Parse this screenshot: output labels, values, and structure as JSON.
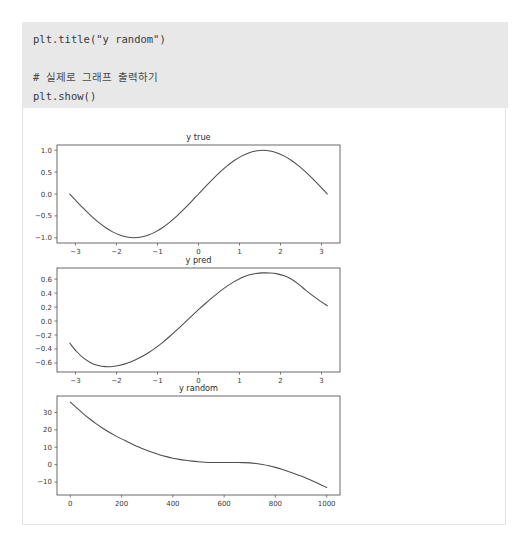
{
  "notebook": {
    "code_cell": {
      "lines": [
        {
          "text": "plt.title(\"y random\")",
          "kind": "code"
        },
        {
          "text": " ",
          "kind": "blank"
        },
        {
          "text": "# 실제로 그래프 출력하기",
          "kind": "comment"
        },
        {
          "text": "plt.show()",
          "kind": "code"
        }
      ],
      "background": "#e8e8e8"
    }
  },
  "chart_data": [
    {
      "type": "line",
      "title": "y true",
      "xlabel": "",
      "ylabel": "",
      "xlim": [
        -3.45,
        3.45
      ],
      "ylim": [
        -1.12,
        1.12
      ],
      "xticks": [
        -3,
        -2,
        -1,
        0,
        1,
        2,
        3
      ],
      "xticklabels": [
        "−3",
        "−2",
        "−1",
        "0",
        "1",
        "2",
        "3"
      ],
      "yticks": [
        -1.0,
        -0.5,
        0.0,
        0.5,
        1.0
      ],
      "yticklabels": [
        "−1.0",
        "−0.5",
        "0.0",
        "0.5",
        "1.0"
      ],
      "grid": false,
      "legend": null,
      "series": [
        {
          "name": "y true",
          "comment": "sin(x) over -pi..pi",
          "x": [
            -3.1416,
            -2.9671,
            -2.7925,
            -2.618,
            -2.4435,
            -2.2689,
            -2.0944,
            -1.9199,
            -1.7453,
            -1.5708,
            -1.3963,
            -1.2217,
            -1.0472,
            -0.8727,
            -0.6981,
            -0.5236,
            -0.3491,
            -0.1745,
            0.0,
            0.1745,
            0.3491,
            0.5236,
            0.6981,
            0.8727,
            1.0472,
            1.2217,
            1.3963,
            1.5708,
            1.7453,
            1.9199,
            2.0944,
            2.2689,
            2.4435,
            2.618,
            2.7925,
            2.9671,
            3.1416
          ],
          "y": [
            0.0,
            -0.1736,
            -0.342,
            -0.5,
            -0.6428,
            -0.766,
            -0.866,
            -0.9397,
            -0.9848,
            -1.0,
            -0.9848,
            -0.9397,
            -0.866,
            -0.766,
            -0.6428,
            -0.5,
            -0.342,
            -0.1736,
            0.0,
            0.1736,
            0.342,
            0.5,
            0.6428,
            0.766,
            0.866,
            0.9397,
            0.9848,
            1.0,
            0.9848,
            0.9397,
            0.866,
            0.766,
            0.6428,
            0.5,
            0.342,
            0.1736,
            0.0
          ]
        }
      ]
    },
    {
      "type": "line",
      "title": "y pred",
      "xlabel": "",
      "ylabel": "",
      "xlim": [
        -3.45,
        3.45
      ],
      "ylim": [
        -0.73,
        0.76
      ],
      "xticks": [
        -3,
        -2,
        -1,
        0,
        1,
        2,
        3
      ],
      "xticklabels": [
        "−3",
        "−2",
        "−1",
        "0",
        "1",
        "2",
        "3"
      ],
      "yticks": [
        -0.6,
        -0.4,
        -0.2,
        0.0,
        0.2,
        0.4,
        0.6
      ],
      "yticklabels": [
        "−0.6",
        "−0.4",
        "−0.2",
        "0.0",
        "0.2",
        "0.4",
        "0.6"
      ],
      "grid": false,
      "legend": null,
      "series": [
        {
          "name": "y pred",
          "comment": "fitted polynomial, shifted sine-like",
          "x": [
            -3.1416,
            -2.9671,
            -2.7925,
            -2.618,
            -2.4435,
            -2.2689,
            -2.0944,
            -1.9199,
            -1.7453,
            -1.5708,
            -1.3963,
            -1.2217,
            -1.0472,
            -0.8727,
            -0.6981,
            -0.5236,
            -0.3491,
            -0.1745,
            0.0,
            0.1745,
            0.3491,
            0.5236,
            0.6981,
            0.8727,
            1.0472,
            1.2217,
            1.3963,
            1.5708,
            1.7453,
            1.9199,
            2.0944,
            2.2689,
            2.4435,
            2.618,
            2.7925,
            2.9671,
            3.1416
          ],
          "y": [
            -0.315,
            -0.44,
            -0.535,
            -0.6,
            -0.638,
            -0.653,
            -0.651,
            -0.634,
            -0.605,
            -0.565,
            -0.515,
            -0.455,
            -0.385,
            -0.305,
            -0.218,
            -0.125,
            -0.03,
            0.068,
            0.163,
            0.255,
            0.342,
            0.425,
            0.5,
            0.565,
            0.62,
            0.66,
            0.682,
            0.69,
            0.688,
            0.676,
            0.648,
            0.598,
            0.525,
            0.44,
            0.36,
            0.285,
            0.22
          ]
        }
      ]
    },
    {
      "type": "line",
      "title": "y random",
      "xlabel": "",
      "ylabel": "",
      "xlim": [
        -52,
        1052
      ],
      "ylim": [
        -17.5,
        39.5
      ],
      "xticks": [
        0,
        200,
        400,
        600,
        800,
        1000
      ],
      "xticklabels": [
        "0",
        "200",
        "400",
        "600",
        "800",
        "1000"
      ],
      "yticks": [
        -10,
        0,
        10,
        20,
        30
      ],
      "yticklabels": [
        "−10",
        "0",
        "10",
        "20",
        "30"
      ],
      "grid": false,
      "legend": null,
      "series": [
        {
          "name": "y random",
          "comment": "exponential decay to plateau then decline",
          "x": [
            0,
            25,
            50,
            75,
            100,
            125,
            150,
            175,
            200,
            225,
            250,
            275,
            300,
            325,
            350,
            375,
            400,
            425,
            450,
            475,
            500,
            525,
            550,
            575,
            600,
            625,
            650,
            675,
            700,
            725,
            750,
            775,
            800,
            825,
            850,
            875,
            900,
            925,
            950,
            975,
            1000
          ],
          "y": [
            36.0,
            32.6,
            29.4,
            26.4,
            23.6,
            21.1,
            18.8,
            16.7,
            14.8,
            13.0,
            11.2,
            9.6,
            8.1,
            6.8,
            5.6,
            4.6,
            3.7,
            3.0,
            2.45,
            2.0,
            1.65,
            1.4,
            1.25,
            1.2,
            1.2,
            1.2,
            1.2,
            1.15,
            1.0,
            0.65,
            0.1,
            -0.65,
            -1.6,
            -2.7,
            -3.9,
            -5.2,
            -6.6,
            -8.1,
            -9.7,
            -11.4,
            -13.2
          ]
        }
      ]
    }
  ]
}
